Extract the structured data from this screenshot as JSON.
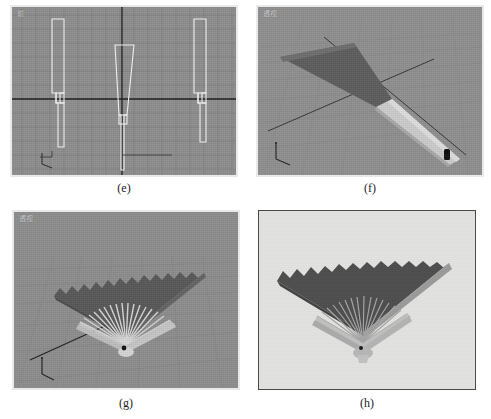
{
  "figure": {
    "kind": "multi-panel figure",
    "panel_count": 4,
    "background_color": "#ffffff",
    "panels": [
      {
        "id": "e",
        "caption": "(e)",
        "viewport_label": "前",
        "viewport_kind": "orthographic-wireframe",
        "background_color": "#8e8e8e",
        "grid_color": "#7c7c7c",
        "axis_color": "#1e1e1e",
        "wire_color": "#f2f2f2",
        "description": "Front viewport with three wireframe fan-rib profiles on a construction grid",
        "object_count": 3,
        "axis_gizmo": "axis-tripod"
      },
      {
        "id": "f",
        "caption": "(f)",
        "viewport_label": "透视",
        "viewport_kind": "perspective-shaded",
        "background_color": "#8e8e8e",
        "grid_color": "#868686",
        "blade_dark_color": "#5a5a5a",
        "blade_light_color": "#c9c9c9",
        "description": "Perspective viewport showing one extruded fan blade with dark leaf section and light rib handle",
        "object_count": 1,
        "axis_gizmo": "axis-tripod",
        "pivot_marker": "pivot-rivet"
      },
      {
        "id": "g",
        "caption": "(g)",
        "viewport_label": "透视",
        "viewport_kind": "perspective-shaded",
        "background_color": "#8d8d8d",
        "grid_color": "#858585",
        "leaf_color": "#585858",
        "rib_color": "#d2d2d2",
        "description": "Perspective viewport with the fully arrayed folding fan: scalloped dark leaf above light radiating ribs",
        "rib_count": 22,
        "axis_gizmo": "axis-tripod",
        "pivot_marker": "pivot-rivet"
      },
      {
        "id": "h",
        "caption": "(h)",
        "viewport_label": "",
        "viewport_kind": "final-render",
        "background_color": "#e2e2e0",
        "leaf_color": "#4d4d4d",
        "rib_color": "#b9b9b9",
        "guard_color": "#a8a8a8",
        "description": "Final rendered image of the folding fan on a light background",
        "rib_count": 22,
        "pivot_marker": "pivot-rivet"
      }
    ]
  }
}
